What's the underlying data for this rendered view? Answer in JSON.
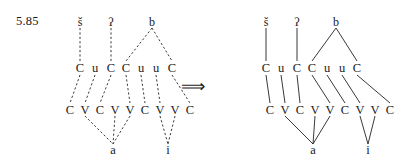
{
  "figure": {
    "example_number": "5.85",
    "arrow": {
      "symbol": "⟹",
      "name": "implies-arrow",
      "x": 203,
      "y": 88
    }
  },
  "diagrams": [
    {
      "id": "left",
      "name": "input-representation",
      "line_style": "dashed",
      "origin_x": 80,
      "tiers": {
        "melody": {
          "label": "consonantal-melody-tier",
          "y": 22,
          "items": [
            {
              "text": "š",
              "x": 80
            },
            {
              "text": "ʔ",
              "x": 111
            },
            {
              "text": "b",
              "x": 152
            }
          ]
        },
        "template": {
          "label": "cv-template-tier",
          "y": 68,
          "items": [
            {
              "text": "C",
              "x": 80
            },
            {
              "text": "u",
              "x": 95
            },
            {
              "text": "C",
              "x": 111
            },
            {
              "text": "C",
              "x": 126
            },
            {
              "text": "u",
              "x": 141
            },
            {
              "text": "u",
              "x": 156
            },
            {
              "text": "C",
              "x": 172
            }
          ]
        },
        "skeleton": {
          "label": "cv-skeleton-tier",
          "y": 110,
          "items": [
            {
              "text": "C",
              "x": 70
            },
            {
              "text": "V",
              "x": 85
            },
            {
              "text": "C",
              "x": 100
            },
            {
              "text": "V",
              "x": 115
            },
            {
              "text": "V",
              "x": 130
            },
            {
              "text": "C",
              "x": 145
            },
            {
              "text": "V",
              "x": 160
            },
            {
              "text": "V",
              "x": 175
            },
            {
              "text": "C",
              "x": 190
            }
          ]
        },
        "vocalic": {
          "label": "vocalic-melody-tier",
          "y": 150,
          "items": [
            {
              "text": "a",
              "x": 113
            },
            {
              "text": "i",
              "x": 168
            }
          ]
        }
      },
      "links": {
        "melody_to_template": [
          {
            "from": [
              80,
              28
            ],
            "to": [
              80,
              61
            ]
          },
          {
            "from": [
              111,
              28
            ],
            "to": [
              111,
              61
            ]
          },
          {
            "from": [
              152,
              28
            ],
            "to": [
              126,
              61
            ]
          },
          {
            "from": [
              152,
              28
            ],
            "to": [
              172,
              61
            ]
          }
        ],
        "template_to_skeleton": [
          {
            "from": [
              80,
              75
            ],
            "to": [
              70,
              103
            ]
          },
          {
            "from": [
              95,
              75
            ],
            "to": [
              85,
              103
            ]
          },
          {
            "from": [
              111,
              75
            ],
            "to": [
              100,
              103
            ]
          },
          {
            "from": [
              126,
              75
            ],
            "to": [
              130,
              103
            ]
          },
          {
            "from": [
              141,
              75
            ],
            "to": [
              145,
              103
            ]
          },
          {
            "from": [
              156,
              75
            ],
            "to": [
              160,
              103
            ]
          },
          {
            "from": [
              172,
              75
            ],
            "to": [
              190,
              103
            ]
          }
        ],
        "skeleton_to_vocalic": [
          {
            "from": [
              85,
              116
            ],
            "to": [
              113,
              144
            ]
          },
          {
            "from": [
              115,
              116
            ],
            "to": [
              113,
              144
            ]
          },
          {
            "from": [
              130,
              116
            ],
            "to": [
              113,
              144
            ]
          },
          {
            "from": [
              160,
              116
            ],
            "to": [
              168,
              144
            ]
          },
          {
            "from": [
              175,
              116
            ],
            "to": [
              168,
              144
            ]
          }
        ]
      }
    },
    {
      "id": "right",
      "name": "output-representation",
      "line_style": "solid",
      "origin_x": 276,
      "tiers": {
        "melody": {
          "label": "consonantal-melody-tier",
          "y": 22,
          "items": [
            {
              "text": "š",
              "x": 266
            },
            {
              "text": "ʔ",
              "x": 297
            },
            {
              "text": "b",
              "x": 336
            }
          ]
        },
        "template": {
          "label": "cv-template-tier",
          "y": 68,
          "items": [
            {
              "text": "C",
              "x": 266
            },
            {
              "text": "u",
              "x": 281
            },
            {
              "text": "C",
              "x": 297
            },
            {
              "text": "C",
              "x": 312
            },
            {
              "text": "u",
              "x": 327
            },
            {
              "text": "u",
              "x": 342
            },
            {
              "text": "C",
              "x": 357
            }
          ]
        },
        "skeleton": {
          "label": "cv-skeleton-tier",
          "y": 110,
          "items": [
            {
              "text": "C",
              "x": 270
            },
            {
              "text": "V",
              "x": 285
            },
            {
              "text": "C",
              "x": 300
            },
            {
              "text": "V",
              "x": 315
            },
            {
              "text": "V",
              "x": 330
            },
            {
              "text": "C",
              "x": 345
            },
            {
              "text": "V",
              "x": 360
            },
            {
              "text": "V",
              "x": 375
            },
            {
              "text": "C",
              "x": 390
            }
          ]
        },
        "vocalic": {
          "label": "vocalic-melody-tier",
          "y": 150,
          "items": [
            {
              "text": "a",
              "x": 313
            },
            {
              "text": "i",
              "x": 368
            }
          ]
        }
      },
      "links": {
        "melody_to_template": [
          {
            "from": [
              266,
              28
            ],
            "to": [
              266,
              61
            ]
          },
          {
            "from": [
              297,
              28
            ],
            "to": [
              297,
              61
            ]
          },
          {
            "from": [
              336,
              28
            ],
            "to": [
              312,
              61
            ]
          },
          {
            "from": [
              336,
              28
            ],
            "to": [
              357,
              61
            ]
          }
        ],
        "template_to_skeleton": [
          {
            "from": [
              266,
              75
            ],
            "to": [
              270,
              103
            ]
          },
          {
            "from": [
              281,
              75
            ],
            "to": [
              285,
              103
            ]
          },
          {
            "from": [
              297,
              75
            ],
            "to": [
              300,
              103
            ]
          },
          {
            "from": [
              312,
              75
            ],
            "to": [
              330,
              103
            ]
          },
          {
            "from": [
              327,
              75
            ],
            "to": [
              345,
              103
            ]
          },
          {
            "from": [
              342,
              75
            ],
            "to": [
              360,
              103
            ]
          },
          {
            "from": [
              357,
              75
            ],
            "to": [
              390,
              103
            ]
          }
        ],
        "skeleton_to_vocalic": [
          {
            "from": [
              285,
              116
            ],
            "to": [
              313,
              144
            ]
          },
          {
            "from": [
              315,
              116
            ],
            "to": [
              313,
              144
            ]
          },
          {
            "from": [
              330,
              116
            ],
            "to": [
              313,
              144
            ]
          },
          {
            "from": [
              360,
              116
            ],
            "to": [
              368,
              144
            ]
          },
          {
            "from": [
              375,
              116
            ],
            "to": [
              368,
              144
            ]
          }
        ]
      }
    }
  ],
  "colors": {
    "ink": "#1a1a1a",
    "line": "#222222",
    "background": "#ffffff"
  }
}
